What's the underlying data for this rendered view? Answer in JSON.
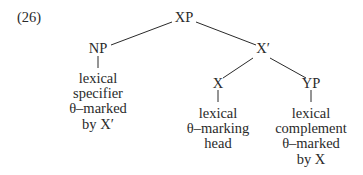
{
  "example_number": "(26)",
  "tree": {
    "root": {
      "label": "XP"
    },
    "nodes": {
      "np": {
        "label": "NP",
        "leaf": [
          "lexical",
          "specifier",
          "θ–marked",
          "by X′"
        ]
      },
      "xbar": {
        "label": "X′"
      },
      "x": {
        "label": "X",
        "leaf": [
          "lexical",
          "θ–marking",
          "head"
        ]
      },
      "yp": {
        "label": "YP",
        "leaf": [
          "lexical",
          "complement",
          "θ–marked",
          "by X"
        ]
      }
    }
  },
  "edges": [
    [
      "XP",
      "NP"
    ],
    [
      "XP",
      "X′"
    ],
    [
      "X′",
      "X"
    ],
    [
      "X′",
      "YP"
    ]
  ],
  "colors": {
    "ink": "#2a2a2a",
    "background": "#ffffff"
  }
}
